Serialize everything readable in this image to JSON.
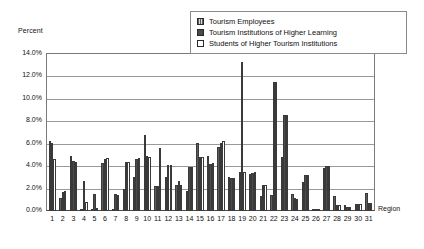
{
  "chart_data": {
    "type": "bar",
    "title": "",
    "xlabel": "Region",
    "ylabel": "Percent",
    "ylim": [
      0,
      14
    ],
    "ytick_labels": [
      "14.0%",
      "12.0%",
      "10.0%",
      "8.0%",
      "6.0%",
      "4.0%",
      "2.0%",
      "0.0%"
    ],
    "ytick_values": [
      14,
      12,
      10,
      8,
      6,
      4,
      2,
      0
    ],
    "grid": true,
    "legend_position": "top-right",
    "categories": [
      "1",
      "2",
      "3",
      "4",
      "5",
      "6",
      "7",
      "8",
      "9",
      "10",
      "11",
      "12",
      "13",
      "14",
      "15",
      "16",
      "17",
      "18",
      "19",
      "20",
      "21",
      "22",
      "23",
      "24",
      "25",
      "26",
      "27",
      "28",
      "29",
      "30",
      "31"
    ],
    "series": [
      {
        "name": "Tourism Employees",
        "color": "#5d5d5d",
        "values": [
          6.2,
          1.2,
          4.9,
          0.1,
          0.1,
          4.3,
          0.1,
          2.0,
          3.0,
          6.8,
          2.2,
          3.0,
          2.3,
          1.8,
          6.1,
          4.9,
          5.7,
          3.0,
          3.5,
          3.3,
          1.3,
          1.4,
          4.8,
          1.5,
          2.6,
          0.1,
          3.8,
          1.3,
          0.5,
          0.6,
          1.6
        ]
      },
      {
        "name": "Tourism Institutions of Higher Learning",
        "color": "#4a4a4a",
        "values": [
          6.1,
          1.7,
          4.5,
          2.7,
          1.5,
          4.6,
          1.5,
          4.4,
          4.6,
          4.9,
          2.2,
          4.1,
          2.7,
          3.9,
          4.8,
          4.2,
          6.1,
          2.9,
          13.3,
          3.4,
          2.3,
          11.5,
          8.6,
          1.2,
          3.2,
          0.2,
          4.0,
          0.5,
          0.4,
          0.6,
          0.7
        ]
      },
      {
        "name": "Students of Higher Tourism Institutions",
        "color": "#ffffff",
        "values": [
          4.6,
          1.8,
          4.4,
          0.8,
          0.3,
          4.7,
          1.4,
          4.4,
          4.7,
          4.8,
          5.6,
          4.1,
          2.3,
          3.9,
          4.8,
          4.3,
          6.2,
          2.9,
          3.5,
          3.5,
          2.3,
          11.5,
          8.6,
          1.1,
          3.2,
          0.2,
          4.0,
          0.5,
          0.4,
          0.6,
          0.7
        ]
      }
    ]
  },
  "legend": {
    "items": [
      {
        "label": "Tourism Employees",
        "swatch": "legend-swatch-hatched"
      },
      {
        "label": "Tourism Institutions of Higher Learning",
        "swatch": "legend-swatch-dark"
      },
      {
        "label": "Students of Higher Tourism Institutions",
        "swatch": "legend-swatch-white"
      }
    ]
  }
}
